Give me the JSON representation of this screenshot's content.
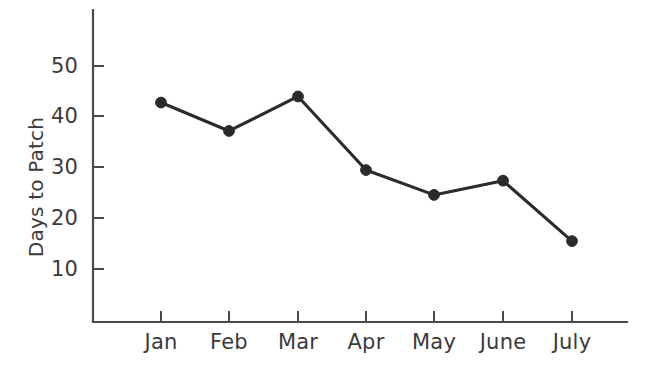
{
  "chart_data": {
    "type": "line",
    "title": "",
    "xlabel": "",
    "ylabel": "Days to Patch",
    "categories": [
      "Jan",
      "Feb",
      "Mar",
      "Apr",
      "May",
      "June",
      "July"
    ],
    "values": [
      42.8,
      37.2,
      44.0,
      29.5,
      24.6,
      27.4,
      15.5
    ],
    "series": [
      {
        "name": "Days to Patch",
        "values": [
          42.8,
          37.2,
          44.0,
          29.5,
          24.6,
          27.4,
          15.5
        ]
      }
    ],
    "y_ticks": [
      10,
      20,
      30,
      40,
      50
    ],
    "y_tick_labels": [
      "10",
      "20",
      "30",
      "40",
      "50"
    ],
    "ylim": [
      0,
      57
    ],
    "grid": false,
    "legend": false,
    "marker": "filled-circle",
    "line_color": "#2b2b2b",
    "axis_color": "#4a4a4a",
    "background_color": "#ffffff"
  },
  "axis": {
    "y_label": "Days to Patch",
    "y_tick_labels": [
      "50",
      "40",
      "30",
      "20",
      "10"
    ],
    "x_tick_labels": [
      "Jan",
      "Feb",
      "Mar",
      "Apr",
      "May",
      "June",
      "July"
    ]
  }
}
